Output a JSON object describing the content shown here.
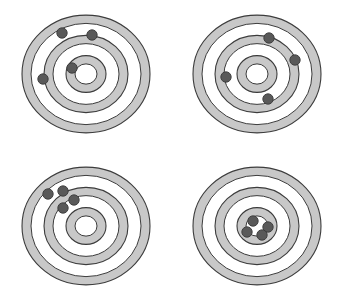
{
  "figure": {
    "width": 348,
    "height": 303,
    "background_color": "#ffffff",
    "layout": "2x2 grid of concentric-ring targets",
    "ring_fill_color": "#c8c8c8",
    "ring_gap_color": "#ffffff",
    "ring_stroke_color": "#3c3c3c",
    "dot_fill_color": "#595959",
    "dot_stroke_color": "#3a3a3a",
    "dot_radius": 5.2
  },
  "targets": [
    {
      "id": "target-top-left",
      "name": "low-accuracy-low-precision",
      "description": "Shots scattered widely and off-center",
      "center": {
        "cx": 86,
        "cy": 74
      },
      "ring_radii": [
        64,
        55,
        42,
        33,
        20,
        11
      ],
      "rings_ry_scale": 0.92,
      "shots": [
        {
          "x": 62,
          "y": 33
        },
        {
          "x": 92,
          "y": 35
        },
        {
          "x": 43,
          "y": 79
        },
        {
          "x": 72,
          "y": 68
        }
      ]
    },
    {
      "id": "target-top-right",
      "name": "high-accuracy-low-precision",
      "description": "Shots spread around a middle ring, centered on average",
      "center": {
        "cx": 257,
        "cy": 74
      },
      "ring_radii": [
        64,
        55,
        42,
        33,
        20,
        11
      ],
      "rings_ry_scale": 0.92,
      "shots": [
        {
          "x": 269,
          "y": 38
        },
        {
          "x": 295,
          "y": 60
        },
        {
          "x": 226,
          "y": 77
        },
        {
          "x": 268,
          "y": 99
        }
      ]
    },
    {
      "id": "target-bottom-left",
      "name": "low-accuracy-high-precision",
      "description": "Shots tightly clustered far from the center",
      "center": {
        "cx": 86,
        "cy": 226
      },
      "ring_radii": [
        64,
        55,
        42,
        33,
        20,
        11
      ],
      "rings_ry_scale": 0.92,
      "shots": [
        {
          "x": 48,
          "y": 194
        },
        {
          "x": 63,
          "y": 191
        },
        {
          "x": 74,
          "y": 200
        },
        {
          "x": 63,
          "y": 208
        }
      ]
    },
    {
      "id": "target-bottom-right",
      "name": "high-accuracy-high-precision",
      "description": "Shots tightly clustered in the bullseye",
      "center": {
        "cx": 257,
        "cy": 226
      },
      "ring_radii": [
        64,
        55,
        42,
        33,
        20,
        11
      ],
      "rings_ry_scale": 0.92,
      "shots": [
        {
          "x": 253,
          "y": 221
        },
        {
          "x": 268,
          "y": 227
        },
        {
          "x": 247,
          "y": 232
        },
        {
          "x": 262,
          "y": 235
        }
      ]
    }
  ]
}
